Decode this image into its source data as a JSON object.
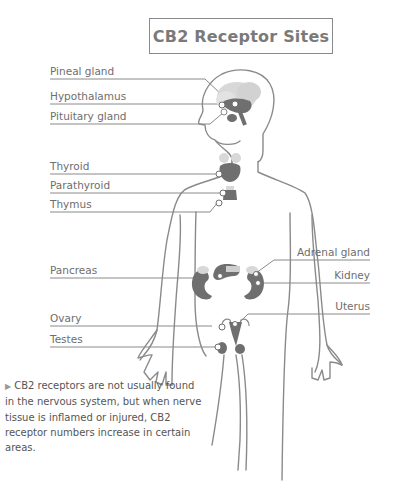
{
  "title": "CB2 Receptor Sites",
  "labels_left": [
    {
      "id": "pineal-gland",
      "text": "Pineal gland"
    },
    {
      "id": "hypothalamus",
      "text": "Hypothalamus"
    },
    {
      "id": "pituitary-gland",
      "text": "Pituitary gland"
    },
    {
      "id": "thyroid",
      "text": "Thyroid"
    },
    {
      "id": "parathyroid",
      "text": "Parathyroid"
    },
    {
      "id": "thymus",
      "text": "Thymus"
    },
    {
      "id": "pancreas",
      "text": "Pancreas"
    },
    {
      "id": "ovary",
      "text": "Ovary"
    },
    {
      "id": "testes",
      "text": "Testes"
    }
  ],
  "labels_right": [
    {
      "id": "adrenal-gland",
      "text": "Adrenal gland"
    },
    {
      "id": "kidney",
      "text": "Kidney"
    },
    {
      "id": "uterus",
      "text": "Uterus"
    }
  ],
  "caption": {
    "marker": "▶",
    "text": "CB2 receptors are not usually found in the nervous system, but when nerve tissue is inflamed or injured, CB2 receptor numbers increase in certain areas."
  },
  "colors": {
    "line": "#8a8a8a",
    "organ_dark": "#6f6f6f",
    "organ_light": "#cfcfcf",
    "text": "#6e6e6e"
  }
}
